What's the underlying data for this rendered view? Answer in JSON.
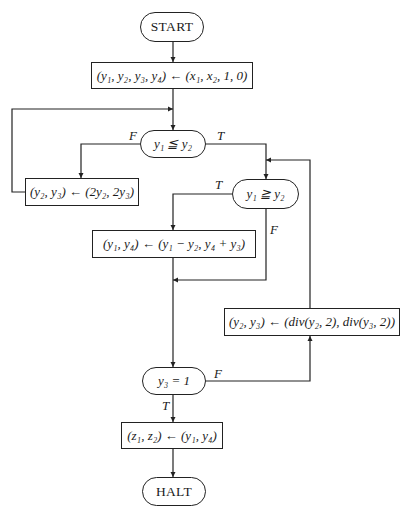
{
  "diagram": {
    "type": "flowchart",
    "nodes": {
      "start": {
        "label": "START",
        "shape": "terminal"
      },
      "init": {
        "label": "(y₁, y₂, y₃, y₄) ← (x₁, x₂, 1, 0)",
        "shape": "process"
      },
      "test1": {
        "label": "y₁ ≦ y₂",
        "shape": "decision"
      },
      "double": {
        "label": "(y₂, y₃) ← (2y₂, 2y₃)",
        "shape": "process"
      },
      "test2": {
        "label": "y₁ ≧ y₂",
        "shape": "decision"
      },
      "subtract": {
        "label": "(y₁, y₄) ← (y₁ − y₂, y₄ + y₃)",
        "shape": "process"
      },
      "halve": {
        "label": "(y₂, y₃) ← (div(y₂, 2), div(y₃, 2))",
        "shape": "process"
      },
      "test3": {
        "label": "y₃ = 1",
        "shape": "decision"
      },
      "output": {
        "label": "(z₁, z₂) ← (y₁, y₄)",
        "shape": "process"
      },
      "halt": {
        "label": "HALT",
        "shape": "terminal"
      }
    },
    "edge_labels": {
      "test1_false": "F",
      "test1_true": "T",
      "test2_true": "T",
      "test2_false": "F",
      "test3_false": "F",
      "test3_true": "T"
    },
    "edges": [
      {
        "from": "start",
        "to": "init"
      },
      {
        "from": "init",
        "to": "test1"
      },
      {
        "from": "test1",
        "to": "double",
        "label": "F"
      },
      {
        "from": "double",
        "to": "test1"
      },
      {
        "from": "test1",
        "to": "test2",
        "label": "T"
      },
      {
        "from": "test2",
        "to": "subtract",
        "label": "T"
      },
      {
        "from": "test2",
        "to": "test3",
        "label": "F"
      },
      {
        "from": "subtract",
        "to": "test3"
      },
      {
        "from": "test3",
        "to": "halve",
        "label": "F"
      },
      {
        "from": "halve",
        "to": "test2"
      },
      {
        "from": "test3",
        "to": "output",
        "label": "T"
      },
      {
        "from": "output",
        "to": "halt"
      }
    ]
  }
}
